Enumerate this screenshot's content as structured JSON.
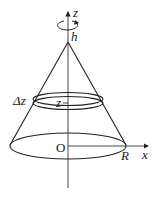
{
  "diagram": {
    "type": "cone-rotation",
    "labels": {
      "z_axis": "z",
      "x_axis": "x",
      "apex": "h",
      "origin": "O",
      "radius": "R",
      "slice_thickness": "Δz",
      "slice_height": "z"
    },
    "colors": {
      "stroke": "#222222",
      "background": "#ffffff"
    }
  }
}
